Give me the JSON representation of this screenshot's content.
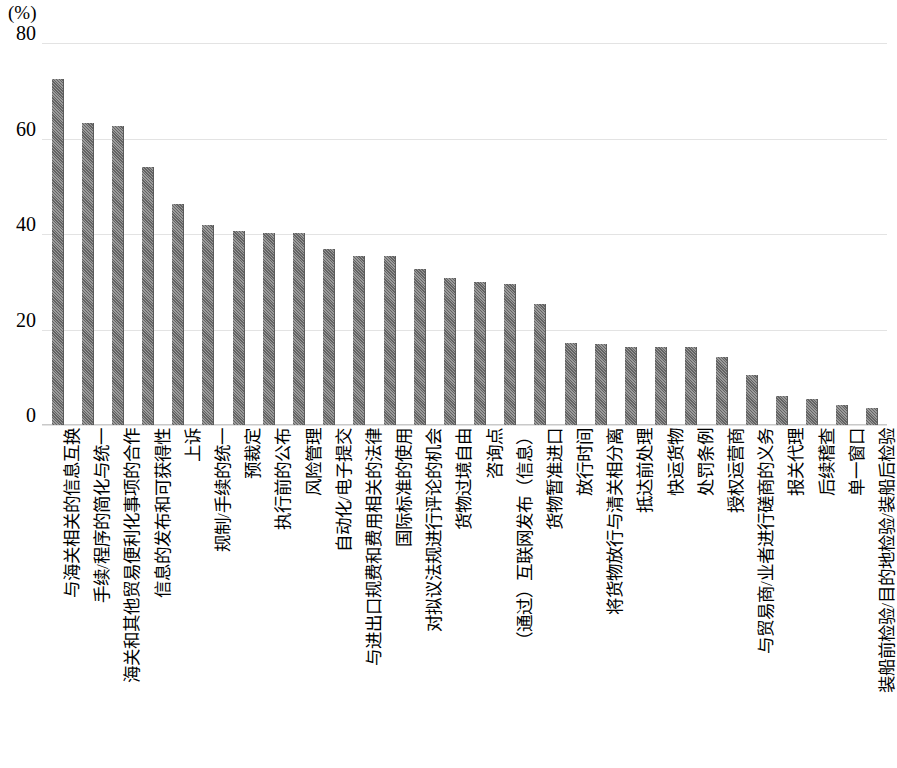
{
  "axis": {
    "unit_label": "(%)",
    "y_ticks": [
      "0",
      "20",
      "40",
      "60",
      "80"
    ]
  },
  "chart_data": {
    "type": "bar",
    "title": "",
    "subtitle": "",
    "xlabel": "",
    "ylabel": "(%)",
    "ylim": [
      0,
      80
    ],
    "ytick_values": [
      0,
      20,
      40,
      60,
      80
    ],
    "grid": true,
    "legend": "none",
    "bar_color": "#6e6e6e",
    "categories": [
      "与海关相关的信息互换",
      "手续/程序的简化与统一",
      "海关和其他贸易便利化事项的合作",
      "信息的发布和可获得性",
      "上诉",
      "规制/手续的统一",
      "预裁定",
      "执行前的公布",
      "风险管理",
      "自动化/电子提交",
      "与进出口规费和费用相关的法律",
      "国际标准的使用",
      "对拟议法规进行评论的机会",
      "货物过境自由",
      "咨询点",
      "（通过）互联网发布（信息）",
      "货物暂准进口",
      "放行时间",
      "将货物放行与清关相分离",
      "抵达前处理",
      "快运货物",
      "处罚条例",
      "授权运营商",
      "与贸易商/业者进行磋商的义务",
      "报关代理",
      "后续稽查",
      "单一窗口",
      "装船前检验/目的地检验/装船后检验"
    ],
    "values": [
      72.5,
      63.2,
      62.7,
      54.0,
      46.3,
      41.8,
      40.6,
      40.2,
      40.2,
      36.8,
      35.5,
      35.5,
      32.6,
      30.8,
      30.0,
      29.6,
      25.4,
      17.2,
      16.9,
      16.4,
      16.4,
      16.4,
      14.2,
      10.5,
      6.1,
      5.4,
      4.2,
      3.6
    ]
  }
}
